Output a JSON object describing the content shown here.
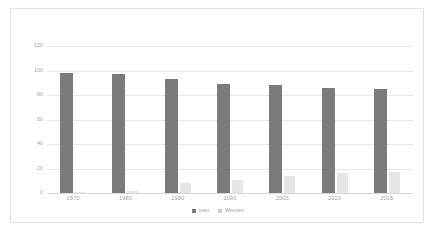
{
  "chart_data": {
    "type": "bar",
    "title": "",
    "subtitle": "",
    "xlabel": "",
    "ylabel": "",
    "categories": [
      "1970",
      "1980",
      "1990",
      "2000",
      "2005",
      "2010",
      "2015"
    ],
    "series": [
      {
        "name": "men",
        "color": "#7b7b7b",
        "values": [
          98,
          97,
          93,
          89,
          88,
          86,
          85
        ]
      },
      {
        "name": "Women",
        "color": "#e6e6e6",
        "values": [
          1,
          2,
          8,
          11,
          14,
          16,
          17
        ]
      }
    ],
    "ylim": [
      0,
      120
    ],
    "ytick_values": [
      0,
      20,
      40,
      60,
      80,
      100,
      120
    ],
    "ytick_labels": [
      "0",
      "20",
      "40",
      "60",
      "80",
      "100",
      "120"
    ],
    "grid": true,
    "grid_color": "#e9e9e9",
    "legend_position": "bottom-center",
    "legend_entries": [
      {
        "label": "men",
        "swatch_color": "#7b7b7b"
      },
      {
        "label": "Women",
        "swatch_color": "#cfcfcf"
      }
    ],
    "plot_background": "#ffffff",
    "border_color": "#e2e2e2",
    "axis_label_color": "#a2a2a2"
  }
}
